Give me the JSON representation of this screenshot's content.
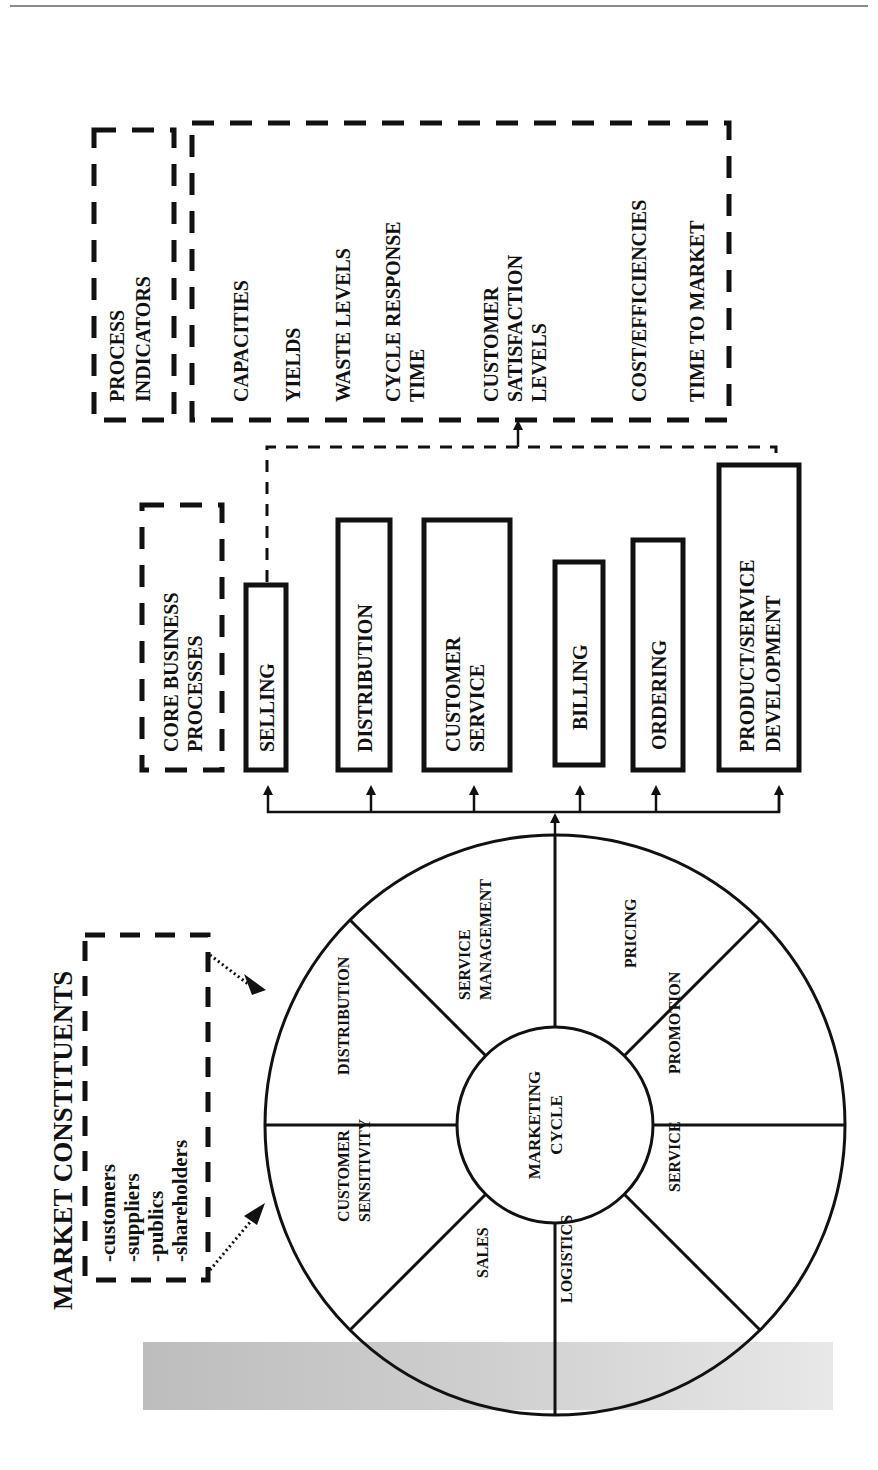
{
  "market_constituents": {
    "title": "MARKET CONSTITUENTS",
    "items": [
      "-customers",
      "-suppliers",
      "-publics",
      "-shareholders"
    ]
  },
  "marketing_wheel": {
    "center": [
      "MARKETING",
      "CYCLE"
    ],
    "segments": [
      {
        "lines": [
          "CUSTOMER",
          "SENSITIVITY"
        ]
      },
      {
        "lines": [
          "DISTRIBUTION"
        ]
      },
      {
        "lines": [
          "SERVICE",
          "MANAGEMENT"
        ]
      },
      {
        "lines": [
          "PRICING"
        ]
      },
      {
        "lines": [
          "PROMOTION"
        ]
      },
      {
        "lines": [
          "SERVICE"
        ]
      },
      {
        "lines": [
          "LOGISTICS"
        ]
      },
      {
        "lines": [
          "SALES"
        ]
      }
    ]
  },
  "core_business_processes": {
    "title": [
      "CORE BUSINESS",
      "PROCESSES"
    ],
    "items": [
      {
        "lines": [
          "SELLING"
        ]
      },
      {
        "lines": [
          "DISTRIBUTION"
        ]
      },
      {
        "lines": [
          "CUSTOMER",
          "SERVICE"
        ]
      },
      {
        "lines": [
          "BILLING"
        ]
      },
      {
        "lines": [
          "ORDERING"
        ]
      },
      {
        "lines": [
          "PRODUCT/SERVICE",
          "DEVELOPMENT"
        ]
      }
    ]
  },
  "process_indicators": {
    "title": [
      "PROCESS",
      "INDICATORS"
    ],
    "items": [
      {
        "lines": [
          "CAPACITIES"
        ]
      },
      {
        "lines": [
          "YIELDS"
        ]
      },
      {
        "lines": [
          "WASTE LEVELS"
        ]
      },
      {
        "lines": [
          "CYCLE RESPONSE",
          "TIME"
        ]
      },
      {
        "lines": [
          "CUSTOMER",
          "SATISFACTION",
          "LEVELS"
        ]
      },
      {
        "lines": [
          "COST/EFFICIENCIES"
        ]
      },
      {
        "lines": [
          "TIME TO MARKET"
        ]
      }
    ]
  }
}
